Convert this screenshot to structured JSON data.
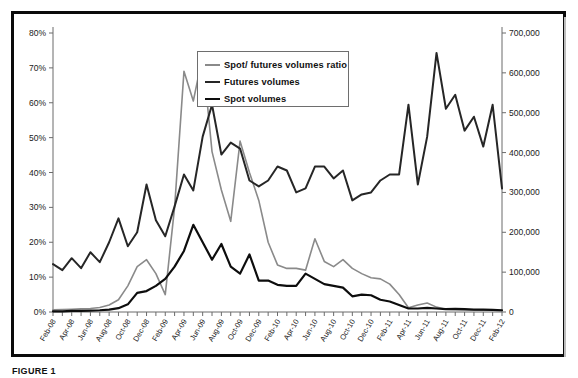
{
  "figure": {
    "caption": "FIGURE 1",
    "frame_color": "#0a0a0a"
  },
  "legend": {
    "position": "top-center",
    "items": [
      {
        "label": "Spot/ futures volumes ratio",
        "color": "#8a8a8a",
        "width": 1.6
      },
      {
        "label": "Futures volumes",
        "color": "#262626",
        "width": 2.0
      },
      {
        "label": "Spot volumes",
        "color": "#0d0d0d",
        "width": 2.2
      }
    ]
  },
  "chart_data": {
    "type": "line",
    "title": "",
    "xlabel": "",
    "ylabel": "",
    "grid": false,
    "legend_position": "top-center",
    "x": [
      "Feb-08",
      "Mar-08",
      "Apr-08",
      "May-08",
      "Jun-08",
      "Jul-08",
      "Aug-08",
      "Sep-08",
      "Oct-08",
      "Nov-08",
      "Dec-08",
      "Jan-09",
      "Feb-09",
      "Mar-09",
      "Apr-09",
      "May-09",
      "Jun-09",
      "Jul-09",
      "Aug-09",
      "Sep-09",
      "Oct-09",
      "Nov-09",
      "Dec-09",
      "Jan-10",
      "Feb-10",
      "Mar-10",
      "Apr-10",
      "May-10",
      "Jun-10",
      "Jul-10",
      "Aug-10",
      "Sep-10",
      "Oct-10",
      "Nov-10",
      "Dec-10",
      "Jan-11",
      "Feb-11",
      "Mar-11",
      "Apr-11",
      "May-11",
      "Jun-11",
      "Jul-11",
      "Aug-11",
      "Sep-11",
      "Oct-11",
      "Nov-11",
      "Dec-11",
      "Jan-12",
      "Feb-12"
    ],
    "x_tick_labels": [
      "Feb-08",
      "Apr-08",
      "Jun-08",
      "Aug-08",
      "Oct-08",
      "Dec-08",
      "Feb-09",
      "Apr-09",
      "Jun-09",
      "Aug-09",
      "Oct-09",
      "Dec-09",
      "Feb-10",
      "Apr-10",
      "Jun-10",
      "Aug-10",
      "Oct-10",
      "Dec-10",
      "Feb-11",
      "Apr-11",
      "Jun-11",
      "Aug-11",
      "Oct-11",
      "Dec-11",
      "Feb-12"
    ],
    "left_axis": {
      "title": "",
      "ylim": [
        0,
        80
      ],
      "ticks": [
        0,
        10,
        20,
        30,
        40,
        50,
        60,
        70,
        80
      ],
      "tick_labels": [
        "0%",
        "10%",
        "20%",
        "30%",
        "40%",
        "50%",
        "60%",
        "70%",
        "80%"
      ],
      "unit": "%"
    },
    "right_axis": {
      "title": "",
      "ylim": [
        0,
        700000
      ],
      "ticks": [
        0,
        100000,
        200000,
        300000,
        400000,
        500000,
        600000,
        700000
      ],
      "tick_labels": [
        "0",
        "100,000",
        "200,000",
        "300,000",
        "400,000",
        "500,000",
        "600,000",
        "700,000"
      ],
      "unit": "contracts"
    },
    "series": [
      {
        "name": "Spot/ futures volumes ratio",
        "axis": "left",
        "color": "#8a8a8a",
        "width": 1.6,
        "values": [
          0.6,
          0.7,
          0.8,
          0.9,
          1.0,
          1.3,
          2.0,
          3.5,
          7.5,
          13.0,
          15.0,
          11.0,
          5.0,
          30.0,
          69.0,
          60.5,
          73.5,
          46.0,
          35.0,
          26.0,
          49.0,
          40.0,
          32.0,
          20.0,
          13.5,
          12.5,
          12.5,
          12.0,
          21.0,
          14.5,
          13.0,
          15.0,
          12.5,
          11.0,
          9.8,
          9.5,
          8.0,
          5.0,
          1.2,
          2.0,
          2.6,
          1.4,
          0.8,
          0.7,
          0.6,
          0.6,
          0.5,
          0.5,
          0.4
        ]
      },
      {
        "name": "Futures volumes",
        "axis": "right",
        "color": "#262626",
        "width": 2.0,
        "values": [
          120000,
          105000,
          135000,
          110000,
          150000,
          125000,
          175000,
          235000,
          165000,
          200000,
          320000,
          230000,
          190000,
          265000,
          345000,
          305000,
          440000,
          520000,
          395000,
          425000,
          410000,
          330000,
          315000,
          330000,
          365000,
          355000,
          300000,
          310000,
          365000,
          365000,
          335000,
          355000,
          280000,
          295000,
          300000,
          330000,
          345000,
          345000,
          520000,
          320000,
          440000,
          650000,
          510000,
          545000,
          455000,
          490000,
          415000,
          520000,
          310000
        ]
      },
      {
        "name": "Spot volumes",
        "axis": "left",
        "color": "#0d0d0d",
        "width": 2.2,
        "values": [
          0.2,
          0.2,
          0.3,
          0.3,
          0.4,
          0.5,
          0.7,
          1.1,
          2.2,
          5.5,
          6.0,
          7.5,
          9.5,
          13.0,
          17.5,
          25.0,
          20.0,
          15.0,
          19.5,
          13.0,
          11.0,
          16.5,
          9.0,
          9.0,
          7.8,
          7.5,
          7.5,
          11.0,
          9.5,
          8.0,
          7.5,
          7.0,
          4.5,
          5.0,
          4.8,
          3.5,
          3.0,
          2.0,
          1.0,
          1.0,
          1.2,
          1.0,
          0.8,
          0.9,
          0.8,
          0.7,
          0.7,
          0.6,
          0.5
        ]
      }
    ]
  }
}
